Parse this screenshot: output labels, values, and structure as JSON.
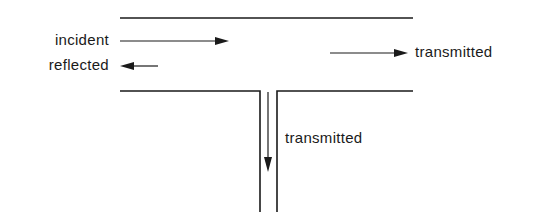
{
  "diagram": {
    "type": "waveguide T-junction",
    "labels": {
      "incident": "incident",
      "reflected": "reflected",
      "transmitted_right": "transmitted",
      "transmitted_down": "transmitted"
    },
    "colors": {
      "ink": "#1a1a1a",
      "background": "#ffffff"
    }
  }
}
